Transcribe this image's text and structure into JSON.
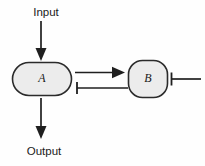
{
  "diagram": {
    "width": 205,
    "height": 166,
    "background_color": "#fefefe",
    "nodes": [
      {
        "id": "A",
        "label": "A",
        "shape": "stadium",
        "fill_color": "#ececec",
        "stroke_color": "#2b2b2b",
        "x": 12,
        "y": 62,
        "width": 60,
        "height": 34,
        "center_x": 42,
        "center_y": 79
      },
      {
        "id": "B",
        "label": "B",
        "shape": "rounded-square",
        "fill_color": "#ececec",
        "stroke_color": "#2b2b2b",
        "x": 128,
        "y": 60,
        "width": 40,
        "height": 38,
        "center_x": 148,
        "center_y": 79
      }
    ],
    "labels": [
      {
        "id": "input",
        "text": "Input",
        "x": 46,
        "y": 13
      },
      {
        "id": "output",
        "text": "Output",
        "x": 44,
        "y": 152
      }
    ],
    "edges": [
      {
        "id": "input-to-a",
        "from": "Input",
        "to": "A",
        "type": "activation",
        "orientation": "vertical",
        "head": "arrow",
        "x": 41,
        "y_start": 21,
        "y_end": 61
      },
      {
        "id": "a-to-b",
        "from": "A",
        "to": "B",
        "type": "activation",
        "orientation": "horizontal",
        "head": "arrow",
        "y": 72.5,
        "x_start": 75,
        "x_end": 124
      },
      {
        "id": "b-to-a",
        "from": "B",
        "to": "A",
        "type": "inhibition",
        "orientation": "horizontal",
        "head": "t-bar",
        "y": 88,
        "x_start": 127,
        "x_end": 76
      },
      {
        "id": "b-to-output-right",
        "from": "B",
        "to": "downstream",
        "type": "inhibition",
        "orientation": "horizontal",
        "head": "t-bar",
        "y": 79,
        "x_start": 201,
        "x_end": 171
      },
      {
        "id": "a-to-output",
        "from": "A",
        "to": "Output",
        "type": "activation",
        "orientation": "vertical",
        "head": "arrow",
        "x": 41,
        "y_start": 98,
        "y_end": 139
      }
    ],
    "colors": {
      "stroke": "#1f1f1f",
      "node_fill": "#ececec",
      "node_stroke": "#2b2b2b",
      "text": "#1a1a1a"
    }
  }
}
